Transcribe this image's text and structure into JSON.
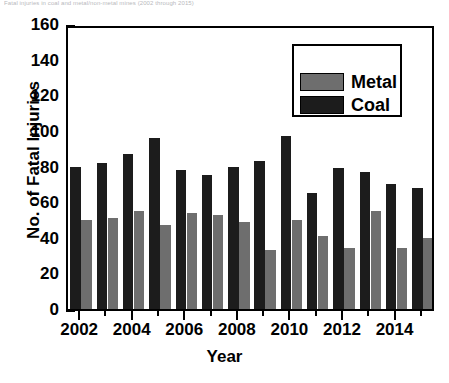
{
  "caption_fragment": "Fatal injuries in coal and metal/non-metal mines (2002 through 2015)",
  "chart_data": {
    "type": "bar",
    "title": "",
    "xlabel": "Year",
    "ylabel": "No. of Fatal Injuries",
    "categories": [
      "2002",
      "2003",
      "2004",
      "2005",
      "2006",
      "2007",
      "2008",
      "2009",
      "2010",
      "2011",
      "2012",
      "2013",
      "2014",
      "2015"
    ],
    "tick_labels_shown": [
      "2002",
      "2004",
      "2006",
      "2008",
      "2010",
      "2012",
      "2014"
    ],
    "series": [
      {
        "name": "Coal",
        "color": "#1c1c1c",
        "values": [
          80,
          82,
          87,
          96,
          78,
          75,
          80,
          83,
          97,
          65,
          79,
          77,
          70,
          68
        ]
      },
      {
        "name": "Metal",
        "color": "#6e6e6e",
        "values": [
          50,
          51,
          55,
          47,
          54,
          53,
          49,
          33,
          50,
          41,
          34,
          55,
          34,
          40
        ]
      }
    ],
    "ylim": [
      0,
      160
    ],
    "yticks": [
      0,
      20,
      40,
      60,
      80,
      100,
      120,
      140,
      160
    ],
    "yminor_step": 10,
    "grid": false,
    "legend_position": "upper-right",
    "bar_order": [
      "Coal",
      "Metal"
    ]
  },
  "legend": {
    "items": [
      {
        "label": "Metal",
        "color": "#6e6e6e"
      },
      {
        "label": "Coal",
        "color": "#1c1c1c"
      }
    ]
  }
}
